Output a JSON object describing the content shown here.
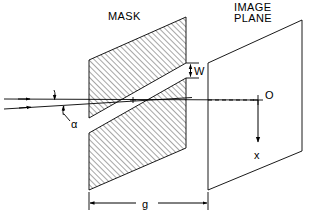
{
  "figure": {
    "title_mask": "MASK",
    "title_image_plane_line1": "IMAGE",
    "title_image_plane_line2": "PLANE",
    "labels": {
      "slit_width": "W",
      "gap_distance": "g",
      "incidence_angle": "α",
      "origin_point": "O",
      "coordinate_axis": "x"
    },
    "colors": {
      "background": "#ffffff",
      "line": "#000000",
      "hatch": "#000000"
    },
    "geometry": {
      "mask": {
        "shape": "parallelogram",
        "top_left": [
          89,
          60
        ],
        "top_right": [
          186,
          17
        ],
        "bottom_right": [
          186,
          148
        ],
        "bottom_left": [
          89,
          190
        ],
        "hatched": true,
        "slit_left_top": [
          89,
          118
        ],
        "slit_left_bottom": [
          89,
          133
        ],
        "slit_right_top": [
          186,
          63
        ],
        "slit_right_bottom": [
          186,
          78
        ]
      },
      "image_plane": {
        "shape": "parallelogram",
        "top_left": [
          208,
          63
        ],
        "top_right": [
          302,
          20
        ],
        "bottom_right": [
          302,
          151
        ],
        "bottom_left": [
          208,
          190
        ],
        "hatched": false
      },
      "optical_axis_y": 100,
      "dashed_segment": [
        208,
        255
      ],
      "origin": [
        258,
        100
      ],
      "x_arrow_end": [
        258,
        145
      ],
      "dimension_line_y": 203,
      "dimension_from_x": 89,
      "dimension_to_x": 208,
      "rays": [
        {
          "from": [
            4,
            99
          ],
          "to": [
            258,
            100
          ],
          "arrow_at": [
            28,
            99
          ]
        },
        {
          "from": [
            4,
            108
          ],
          "to": [
            190,
            97
          ],
          "arrow_at": [
            30,
            107
          ]
        }
      ]
    }
  }
}
